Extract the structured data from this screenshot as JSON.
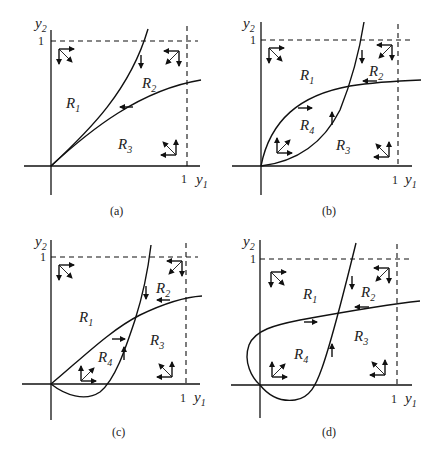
{
  "figure": {
    "axis_labels": {
      "x": "y",
      "x_sub": "1",
      "y": "y",
      "y_sub": "2"
    },
    "tick_one": "1",
    "region_prefix": "R",
    "panels": [
      {
        "id": "a",
        "caption": "(a)",
        "regions": [
          {
            "name": "1",
            "glyph": "R1"
          },
          {
            "name": "2",
            "glyph": "R2"
          },
          {
            "name": "3",
            "glyph": "R3"
          }
        ]
      },
      {
        "id": "b",
        "caption": "(b)",
        "regions": [
          {
            "name": "1",
            "glyph": "R1"
          },
          {
            "name": "2",
            "glyph": "R2"
          },
          {
            "name": "3",
            "glyph": "R3"
          },
          {
            "name": "4",
            "glyph": "R4"
          }
        ]
      },
      {
        "id": "c",
        "caption": "(c)",
        "regions": [
          {
            "name": "1",
            "glyph": "R1"
          },
          {
            "name": "2",
            "glyph": "R2"
          },
          {
            "name": "3",
            "glyph": "R3"
          },
          {
            "name": "4",
            "glyph": "R4"
          }
        ]
      },
      {
        "id": "d",
        "caption": "(d)",
        "regions": [
          {
            "name": "1",
            "glyph": "R1"
          },
          {
            "name": "2",
            "glyph": "R2"
          },
          {
            "name": "3",
            "glyph": "R3"
          },
          {
            "name": "4",
            "glyph": "R4"
          }
        ]
      }
    ],
    "glyph_directions": {
      "R1": [
        "right",
        "down",
        "down-right"
      ],
      "R2": [
        "left",
        "down",
        "down-left"
      ],
      "R3": [
        "up",
        "left",
        "up-left"
      ],
      "R4": [
        "up",
        "right",
        "up-right"
      ]
    }
  }
}
